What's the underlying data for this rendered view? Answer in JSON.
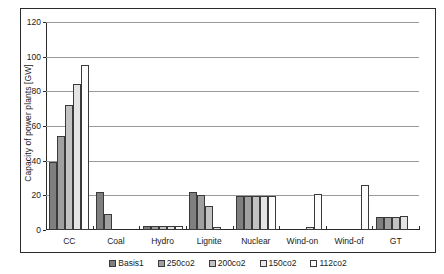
{
  "chart_data": {
    "type": "bar",
    "title": "",
    "xlabel": "",
    "ylabel": "Capacity of power plants [GW]",
    "ylim": [
      0,
      120
    ],
    "ytick_values": [
      0,
      20,
      40,
      60,
      80,
      100,
      120
    ],
    "ytick_labels": [
      "0",
      "20",
      "40",
      "60",
      "80",
      "100",
      "120"
    ],
    "grid": true,
    "legend_position": "bottom",
    "categories": [
      "CC",
      "Coal",
      "Hydro",
      "Lignite",
      "Nuclear",
      "Wind-on",
      "Wind-of",
      "GT"
    ],
    "series": [
      {
        "name": "Basis1",
        "values": [
          39,
          22,
          2.5,
          22,
          19.5,
          0,
          0,
          7.5
        ]
      },
      {
        "name": "250co2",
        "values": [
          54,
          9.5,
          2.5,
          20,
          19.5,
          0,
          0,
          7.5
        ]
      },
      {
        "name": "200co2",
        "values": [
          72,
          0,
          2.5,
          14,
          19.5,
          0,
          0,
          7.5
        ]
      },
      {
        "name": "150co2",
        "values": [
          84,
          0,
          2.5,
          2,
          19.5,
          1.5,
          0,
          8.0
        ]
      },
      {
        "name": "112co2",
        "values": [
          95,
          0,
          2.5,
          0,
          19.5,
          21,
          26,
          0
        ]
      }
    ]
  },
  "legend": {
    "items": [
      {
        "label": "Basis1"
      },
      {
        "label": "250co2"
      },
      {
        "label": "200co2"
      },
      {
        "label": "150co2"
      },
      {
        "label": "112co2"
      }
    ]
  }
}
